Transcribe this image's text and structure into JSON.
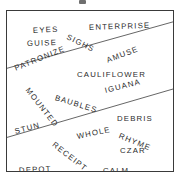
{
  "puzzle": {
    "type": "word-search-grid",
    "border_color": "#3a3a3a",
    "text_color": "#2b2b2b",
    "background_color": "#ffffff",
    "divider_color": "#555555",
    "box": {
      "left": 6,
      "top": 10,
      "width": 168,
      "height": 162
    },
    "dividers": [
      {
        "name": "upper-divider",
        "x1": 0,
        "y1": 58,
        "x2": 168,
        "y2": 11
      },
      {
        "name": "lower-divider",
        "x1": 0,
        "y1": 128,
        "x2": 168,
        "y2": 79
      }
    ],
    "words": [
      {
        "text": "EYES",
        "x": 26,
        "y": 16,
        "rotation": -3,
        "size": 7.8
      },
      {
        "text": "ENTERPRISE",
        "x": 82,
        "y": 13,
        "rotation": -2,
        "size": 7.8
      },
      {
        "text": "GUISE",
        "x": 20,
        "y": 29,
        "rotation": -2,
        "size": 7.8
      },
      {
        "text": "SIGHS",
        "x": 60,
        "y": 22,
        "rotation": 26,
        "size": 7.8
      },
      {
        "text": "PATRONIZE",
        "x": 8,
        "y": 54,
        "rotation": -22,
        "size": 7.8
      },
      {
        "text": "AMUSE",
        "x": 100,
        "y": 46,
        "rotation": -21,
        "size": 7.8
      },
      {
        "text": "CAULIFLOWER",
        "x": 70,
        "y": 60,
        "rotation": 0,
        "size": 7.8
      },
      {
        "text": "MOUNTED",
        "x": 20,
        "y": 74,
        "rotation": 52,
        "size": 7.8
      },
      {
        "text": "BAUBLES",
        "x": 48,
        "y": 83,
        "rotation": 17,
        "size": 7.8
      },
      {
        "text": "IGUANA",
        "x": 98,
        "y": 76,
        "rotation": -14,
        "size": 7.8
      },
      {
        "text": "DEBRIS",
        "x": 110,
        "y": 104,
        "rotation": 0,
        "size": 7.8
      },
      {
        "text": "STUN",
        "x": 8,
        "y": 117,
        "rotation": -15,
        "size": 7.8
      },
      {
        "text": "WHOLE",
        "x": 70,
        "y": 122,
        "rotation": -12,
        "size": 7.8
      },
      {
        "text": "RHYME",
        "x": 112,
        "y": 121,
        "rotation": 22,
        "size": 7.8
      },
      {
        "text": "RECEIPT",
        "x": 46,
        "y": 129,
        "rotation": 38,
        "size": 7.8
      },
      {
        "text": "CZAR",
        "x": 113,
        "y": 136,
        "rotation": 0,
        "size": 7.8
      },
      {
        "text": "DEPOT",
        "x": 12,
        "y": 156,
        "rotation": -3,
        "size": 7.8
      },
      {
        "text": "CALM",
        "x": 96,
        "y": 156,
        "rotation": 0,
        "size": 7.8
      }
    ]
  }
}
